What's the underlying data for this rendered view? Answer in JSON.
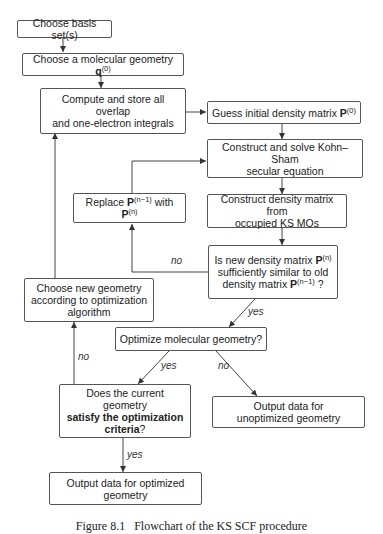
{
  "diagram": {
    "nodes": {
      "basis": {
        "text": "Choose basis set(s)"
      },
      "geometry": {
        "text": "Choose a molecular geometry ",
        "bold_symbol": "q",
        "sup": "(0)"
      },
      "compute": {
        "line1": "Compute and store all overlap",
        "line2": "and one-electron integrals"
      },
      "guess": {
        "text": "Guess initial density matrix ",
        "bold_symbol": "P",
        "sup": "(0)"
      },
      "solve": {
        "line1": "Construct and solve Kohn–Sham",
        "line2": "secular equation"
      },
      "construct": {
        "line1": "Construct density matrix from",
        "line2": "occupied KS MOs"
      },
      "replace": {
        "prefix": "Replace ",
        "symbol1": "P",
        "sup1": "(n−1)",
        "middle": " with ",
        "symbol2": "P",
        "sup2": "(n)"
      },
      "converged": {
        "line1_prefix": "Is new density matrix ",
        "symbol1": "P",
        "sup1": "(n)",
        "line2": "sufficiently similar to old",
        "line3_prefix": "density matrix ",
        "symbol2": "P",
        "sup2": "(n−1)",
        "line3_suffix": " ?"
      },
      "new_geometry": {
        "line1": "Choose new geometry",
        "line2": "according to optimization",
        "line3": "algorithm"
      },
      "optimize": {
        "text": "Optimize molecular geometry?"
      },
      "criteria": {
        "line1": "Does the current geometry",
        "line2_bold": "satisfy the optimization",
        "line3_bold": "criteria",
        "line3_suffix": "?"
      },
      "unoptimized": {
        "line1": "Output data for",
        "line2": "unoptimized geometry"
      },
      "optimized": {
        "line1": "Output data for optimized",
        "line2": "geometry"
      }
    },
    "edge_labels": {
      "converged_no": "no",
      "converged_yes": "yes",
      "optimize_yes": "yes",
      "optimize_no": "no",
      "criteria_no": "no",
      "criteria_yes": "yes"
    },
    "caption": "Figure 8.1   Flowchart of the KS SCF procedure"
  }
}
